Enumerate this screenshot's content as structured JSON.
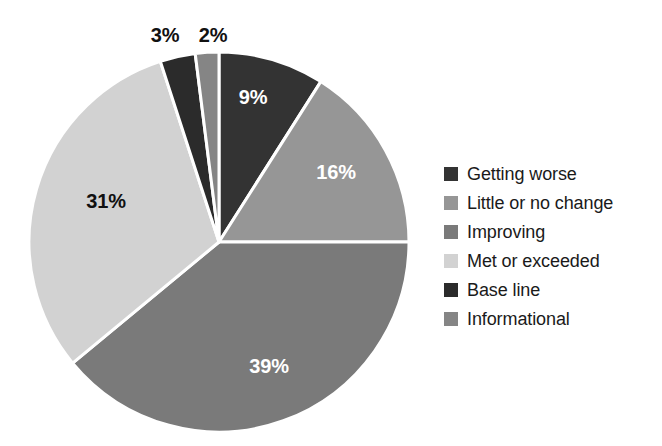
{
  "chart_data": {
    "type": "pie",
    "title": "",
    "subtitle": "",
    "xlabel": "",
    "ylabel": "",
    "legend_position": "right",
    "grid": false,
    "start_angle_deg": 0,
    "direction": "clockwise",
    "categories": [
      "Getting worse",
      "Little or no change",
      "Improving",
      "Met or exceeded",
      "Base line",
      "Informational"
    ],
    "values": [
      9,
      16,
      39,
      31,
      3,
      2
    ],
    "value_labels": [
      "9%",
      "16%",
      "39%",
      "31%",
      "3%",
      "2%"
    ],
    "colors": [
      "#333333",
      "#969696",
      "#7a7a7a",
      "#d2d2d2",
      "#2b2b2b",
      "#858585"
    ],
    "slices": [
      {
        "label": "Getting worse",
        "value": 9,
        "display": "9%",
        "color": "#333333",
        "label_color": "#ffffff",
        "label_placement": "inside"
      },
      {
        "label": "Little or no change",
        "value": 16,
        "display": "16%",
        "color": "#969696",
        "label_color": "#ffffff",
        "label_placement": "inside"
      },
      {
        "label": "Improving",
        "value": 39,
        "display": "39%",
        "color": "#7a7a7a",
        "label_color": "#ffffff",
        "label_placement": "inside"
      },
      {
        "label": "Met or exceeded",
        "value": 31,
        "display": "31%",
        "color": "#d2d2d2",
        "label_color": "#111111",
        "label_placement": "inside"
      },
      {
        "label": "Base line",
        "value": 3,
        "display": "3%",
        "color": "#2b2b2b",
        "label_color": "#111111",
        "label_placement": "outside"
      },
      {
        "label": "Informational",
        "value": 2,
        "display": "2%",
        "color": "#858585",
        "label_color": "#111111",
        "label_placement": "outside"
      }
    ]
  },
  "legend": {
    "items": [
      {
        "label": "Getting worse",
        "color": "#333333"
      },
      {
        "label": "Little or no change",
        "color": "#969696"
      },
      {
        "label": "Improving",
        "color": "#7a7a7a"
      },
      {
        "label": "Met or exceeded",
        "color": "#d2d2d2"
      },
      {
        "label": "Base line",
        "color": "#2b2b2b"
      },
      {
        "label": "Informational",
        "color": "#858585"
      }
    ]
  },
  "geometry": {
    "cx": 219,
    "cy": 242,
    "r": 190,
    "separator_color": "#ffffff",
    "separator_width": 3
  },
  "background": "#ffffff"
}
